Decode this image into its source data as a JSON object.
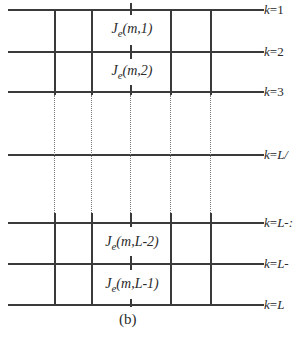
{
  "diagram": {
    "caption": "(b)",
    "row_labels": [
      {
        "var": "k",
        "eq": "=",
        "val": "1",
        "y": 10
      },
      {
        "var": "k",
        "eq": "=",
        "val": "2",
        "y": 52
      },
      {
        "var": "k",
        "eq": "=",
        "val": "3",
        "y": 92
      },
      {
        "var": "k",
        "eq": "=",
        "val": "L/",
        "y": 155
      },
      {
        "var": "k",
        "eq": "=",
        "val": "L-:",
        "y": 223
      },
      {
        "var": "k",
        "eq": "=",
        "val": "L-",
        "y": 264
      },
      {
        "var": "k",
        "eq": "=",
        "val": "L",
        "y": 305
      }
    ],
    "cells": [
      {
        "J": "J",
        "sub": "e",
        "args": "(m,1)"
      },
      {
        "J": "J",
        "sub": "e",
        "args": "(m,2)"
      },
      {
        "J": "J",
        "sub": "e",
        "args": "(m,L-2)"
      },
      {
        "J": "J",
        "sub": "e",
        "args": "(m,L-1)"
      }
    ],
    "colors": {
      "line": "#3a3a3a",
      "text": "#2a2a2a",
      "background": "#ffffff"
    }
  }
}
